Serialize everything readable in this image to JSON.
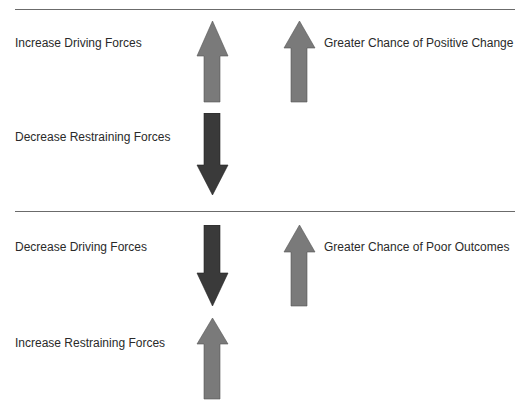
{
  "colors": {
    "up_arrow": "#7a7a7a",
    "down_arrow": "#3a3a3a",
    "rule": "#6b6b6b",
    "text": "#2a2a2a"
  },
  "top_panel": {
    "driving_label": "Increase Driving Forces",
    "restraining_label": "Decrease Restraining Forces",
    "result_label": "Greater Chance of Positive Change",
    "driving_arrow": "up",
    "restraining_arrow": "down",
    "result_arrow": "up"
  },
  "bottom_panel": {
    "driving_label": "Decrease Driving Forces",
    "restraining_label": "Increase Restraining Forces",
    "result_label": "Greater Chance of Poor Outcomes",
    "driving_arrow": "down",
    "restraining_arrow": "up",
    "result_arrow": "up"
  }
}
